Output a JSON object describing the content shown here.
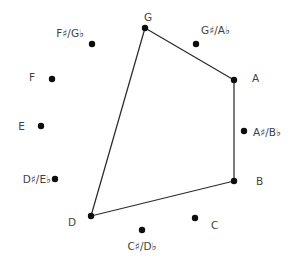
{
  "figure": {
    "name": "chromatic-circle-note-diagram",
    "background": "#ffffff",
    "dot_color": "#0d0d0d",
    "line_color": "#2b2b2b",
    "label_color": "#3f3f3f",
    "dot_radius": 3.2,
    "line_width": 1.25,
    "notes": [
      {
        "label": "G",
        "dot": [
          145,
          28
        ],
        "label_pos": [
          148,
          21
        ],
        "anchor": "middle"
      },
      {
        "label": "G♯/A♭",
        "dot": [
          196,
          44
        ],
        "label_pos": [
          201,
          34
        ],
        "anchor": "start"
      },
      {
        "label": "A",
        "dot": [
          234,
          80
        ],
        "label_pos": [
          252,
          82
        ],
        "anchor": "start"
      },
      {
        "label": "A♯/B♭",
        "dot": [
          244,
          131
        ],
        "label_pos": [
          253,
          136
        ],
        "anchor": "start"
      },
      {
        "label": "B",
        "dot": [
          234,
          181
        ],
        "label_pos": [
          256,
          185
        ],
        "anchor": "start"
      },
      {
        "label": "C",
        "dot": [
          195,
          218
        ],
        "label_pos": [
          211,
          229
        ],
        "anchor": "start"
      },
      {
        "label": "C♯/D♭",
        "dot": [
          142,
          230
        ],
        "label_pos": [
          142,
          250
        ],
        "anchor": "middle"
      },
      {
        "label": "D",
        "dot": [
          91,
          216
        ],
        "label_pos": [
          76,
          226
        ],
        "anchor": "end"
      },
      {
        "label": "D♯/E♭",
        "dot": [
          55,
          179
        ],
        "label_pos": [
          51,
          183
        ],
        "anchor": "end"
      },
      {
        "label": "E",
        "dot": [
          41,
          126
        ],
        "label_pos": [
          25,
          130
        ],
        "anchor": "end"
      },
      {
        "label": "F",
        "dot": [
          52,
          79
        ],
        "label_pos": [
          35,
          81
        ],
        "anchor": "end"
      },
      {
        "label": "F♯/G♭",
        "dot": [
          92,
          44
        ],
        "label_pos": [
          84,
          37
        ],
        "anchor": "end"
      }
    ],
    "polygon_vertices": [
      "G",
      "A",
      "B",
      "D"
    ]
  }
}
